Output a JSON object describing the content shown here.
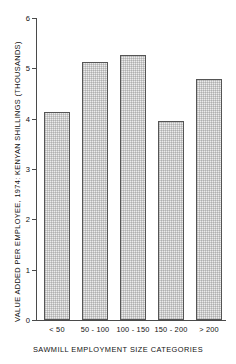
{
  "chart_data": {
    "type": "bar",
    "title": "",
    "subtitle": "",
    "categories": [
      "< 50",
      "50 - 100",
      "100 - 150",
      "150 - 200",
      "> 200"
    ],
    "values": [
      4.13,
      5.13,
      5.27,
      3.96,
      4.79
    ],
    "xlabel": "SAWMILL EMPLOYMENT SIZE CATEGORIES",
    "ylabel": "VALUE ADDED PER EMPLOYEE, 1974: KENYAN SHILLINGS (THOUSANDS)",
    "ylim": [
      0,
      6
    ],
    "yticks": [
      "0",
      "1",
      "2",
      "3",
      "4",
      "5",
      "6"
    ],
    "ytick_values": [
      0,
      1,
      2,
      3,
      4,
      5,
      6
    ],
    "grid": false,
    "legend": null,
    "legend_position": "none",
    "bar_fill_color": "#ececec",
    "bar_edge_color": "#555555",
    "axis_color": "#4a4a4a",
    "background_color": "#ffffff"
  }
}
